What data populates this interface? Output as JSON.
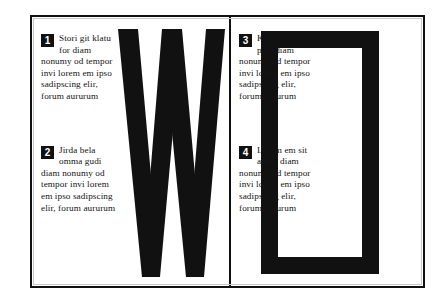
{
  "document": {
    "title": "Typographic specimen spread",
    "border_color": "#111111",
    "ink_color": "#141414",
    "paper_color": "#ffffff"
  },
  "left_page": {
    "letterform": {
      "glyph": "W",
      "name": "letter-w-glyph",
      "color": "#111111"
    },
    "blocks": [
      {
        "number": "1",
        "lead": "Stori git klatu for",
        "body": "diam nonumy od tempor invi lorem em ipso sadipscing elir, forum aururum"
      },
      {
        "number": "2",
        "lead": "Jirda bela omma gudi",
        "body": "diam nonumy od tempor invi lorem em ipso sadipscing elir, forum aururum"
      }
    ]
  },
  "right_page": {
    "letterform": {
      "glyph": "O",
      "name": "letter-o-glyph",
      "color": "#111111"
    },
    "blocks": [
      {
        "number": "3",
        "lead": "Kola blua jini pusi",
        "body": "diam nonumy od tempor invi lorem em ipso sadipscing elir, forum aururum"
      },
      {
        "number": "4",
        "lead": "Lorem em sit amet,",
        "body": "diam nonumy od tempor invi lorem em ipso sadipscing elir, forum aururum"
      }
    ]
  }
}
